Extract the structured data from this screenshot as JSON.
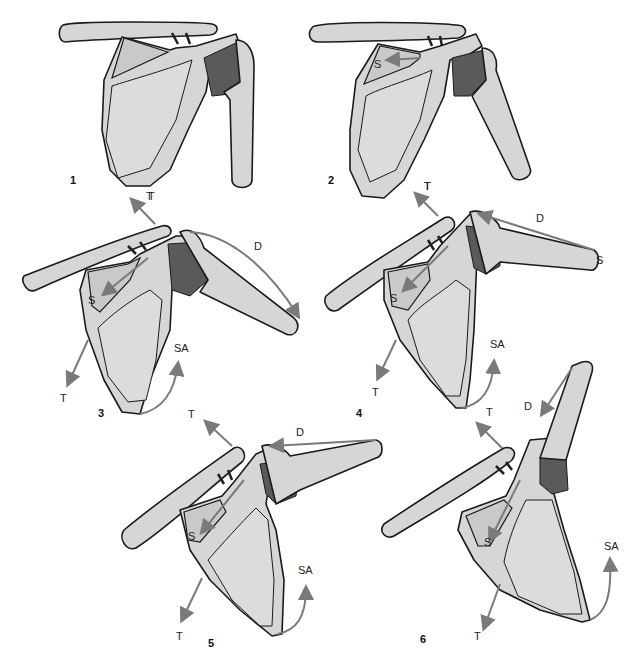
{
  "diagram": {
    "panels": [
      {
        "number": "1",
        "labels": [
          "T"
        ]
      },
      {
        "number": "2",
        "labels": [
          "S",
          "T"
        ]
      },
      {
        "number": "3",
        "labels": [
          "T",
          "D",
          "S",
          "SA",
          "T"
        ]
      },
      {
        "number": "4",
        "labels": [
          "T",
          "D",
          "S",
          "S",
          "SA",
          "T"
        ]
      },
      {
        "number": "5",
        "labels": [
          "T",
          "D",
          "S",
          "SA",
          "T"
        ]
      },
      {
        "number": "6",
        "labels": [
          "T",
          "D",
          "S",
          "SA",
          "T"
        ]
      }
    ],
    "legend_abbreviations": [
      "T",
      "S",
      "D",
      "SA"
    ],
    "colors": {
      "bone_fill": "#d6d6d6",
      "outline": "#1a1a1a",
      "muscle_fill": "#5a5a5a",
      "arrow": "#7a7a7a",
      "background": "#ffffff"
    }
  }
}
